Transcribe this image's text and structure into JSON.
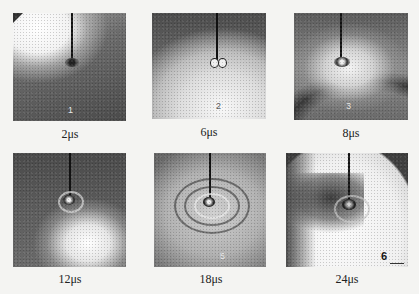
{
  "figure": {
    "frames": [
      {
        "index": 1,
        "label": "1",
        "caption": "2μs"
      },
      {
        "index": 2,
        "label": "2",
        "caption": "6μs"
      },
      {
        "index": 3,
        "label": "3",
        "caption": "8μs"
      },
      {
        "index": 4,
        "label": "4",
        "caption": "12μs"
      },
      {
        "index": 5,
        "label": "5",
        "caption": "18μs"
      },
      {
        "index": 6,
        "label": "6",
        "caption": "24μs"
      }
    ]
  }
}
